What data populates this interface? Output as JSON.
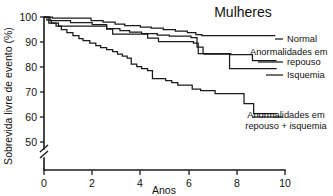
{
  "chart_data": {
    "type": "line",
    "title": "Mulheres",
    "xlabel": "Anos",
    "ylabel": "Sobrevida livre de evento (%)",
    "xlim": [
      0,
      10
    ],
    "ylim": [
      50,
      100
    ],
    "yaxis_break": true,
    "grid": false,
    "legend_position": "right-inline",
    "xticks": [
      "0",
      "2",
      "4",
      "6",
      "8",
      "10"
    ],
    "xtick_values": [
      0,
      2,
      4,
      6,
      8,
      10
    ],
    "yticks": [
      "50",
      "60",
      "70",
      "80",
      "90",
      "100"
    ],
    "ytick_values": [
      50,
      60,
      70,
      80,
      90,
      100
    ],
    "series": [
      {
        "name": "Normal",
        "label": "Normal",
        "end_value": 92.5,
        "points": [
          [
            0.0,
            100.0
          ],
          [
            0.35,
            100.0
          ],
          [
            0.35,
            99.6
          ],
          [
            1.95,
            99.6
          ],
          [
            1.95,
            98.6
          ],
          [
            2.45,
            98.6
          ],
          [
            2.45,
            98.0
          ],
          [
            2.95,
            98.0
          ],
          [
            2.95,
            97.2
          ],
          [
            3.35,
            97.2
          ],
          [
            3.35,
            96.6
          ],
          [
            4.0,
            96.6
          ],
          [
            4.0,
            96.0
          ],
          [
            4.45,
            96.0
          ],
          [
            4.45,
            95.6
          ],
          [
            4.95,
            95.6
          ],
          [
            4.95,
            95.0
          ],
          [
            5.45,
            95.0
          ],
          [
            5.45,
            94.4
          ],
          [
            5.95,
            94.4
          ],
          [
            5.95,
            93.8
          ],
          [
            6.3,
            93.8
          ],
          [
            6.3,
            93.0
          ],
          [
            6.55,
            93.0
          ],
          [
            6.55,
            92.6
          ],
          [
            9.6,
            92.6
          ]
        ]
      },
      {
        "name": "Anormalidades em repouso",
        "label_line1": "Anormalidades em",
        "label_line2": "repouso",
        "end_value": 82.5,
        "points": [
          [
            0.0,
            100.0
          ],
          [
            0.25,
            100.0
          ],
          [
            0.25,
            98.6
          ],
          [
            1.1,
            98.6
          ],
          [
            1.1,
            97.8
          ],
          [
            2.0,
            97.8
          ],
          [
            2.0,
            97.0
          ],
          [
            2.6,
            97.0
          ],
          [
            2.6,
            95.4
          ],
          [
            3.15,
            95.4
          ],
          [
            3.15,
            94.6
          ],
          [
            3.55,
            94.6
          ],
          [
            3.55,
            94.0
          ],
          [
            4.05,
            94.0
          ],
          [
            4.05,
            93.4
          ],
          [
            4.7,
            93.4
          ],
          [
            4.7,
            92.8
          ],
          [
            5.2,
            92.8
          ],
          [
            5.2,
            92.4
          ],
          [
            6.1,
            92.4
          ],
          [
            6.1,
            91.8
          ],
          [
            6.35,
            91.8
          ],
          [
            6.35,
            88.0
          ],
          [
            6.6,
            88.0
          ],
          [
            6.6,
            85.4
          ],
          [
            7.75,
            85.4
          ],
          [
            7.75,
            85.0
          ],
          [
            8.65,
            85.0
          ],
          [
            8.65,
            82.6
          ],
          [
            9.65,
            82.6
          ]
        ]
      },
      {
        "name": "Isquemia",
        "label": "Isquemia",
        "end_value": 79.5,
        "points": [
          [
            0.0,
            100.0
          ],
          [
            0.2,
            100.0
          ],
          [
            0.2,
            97.6
          ],
          [
            0.6,
            97.6
          ],
          [
            0.6,
            96.4
          ],
          [
            2.6,
            96.4
          ],
          [
            2.6,
            95.2
          ],
          [
            2.85,
            95.2
          ],
          [
            2.85,
            93.2
          ],
          [
            4.3,
            93.2
          ],
          [
            4.3,
            91.6
          ],
          [
            4.75,
            91.6
          ],
          [
            4.75,
            90.2
          ],
          [
            6.2,
            90.2
          ],
          [
            6.2,
            89.6
          ],
          [
            6.4,
            89.6
          ],
          [
            6.4,
            85.4
          ],
          [
            6.65,
            85.4
          ],
          [
            6.65,
            85.2
          ],
          [
            7.7,
            85.2
          ],
          [
            7.7,
            79.4
          ],
          [
            9.65,
            79.4
          ]
        ]
      },
      {
        "name": "Anormalidades em repouso + isquemia",
        "label_line1": "Anormalidades em",
        "label_line2": "repouso + isquemia",
        "end_value": 61.5,
        "points": [
          [
            0.0,
            100.0
          ],
          [
            0.12,
            100.0
          ],
          [
            0.12,
            98.8
          ],
          [
            0.3,
            98.8
          ],
          [
            0.3,
            97.6
          ],
          [
            0.5,
            97.6
          ],
          [
            0.5,
            96.4
          ],
          [
            0.72,
            96.4
          ],
          [
            0.72,
            95.0
          ],
          [
            0.95,
            95.0
          ],
          [
            0.95,
            93.8
          ],
          [
            1.2,
            93.8
          ],
          [
            1.2,
            92.6
          ],
          [
            1.45,
            92.6
          ],
          [
            1.45,
            91.4
          ],
          [
            1.62,
            91.4
          ],
          [
            1.62,
            90.6
          ],
          [
            1.9,
            90.6
          ],
          [
            1.9,
            89.6
          ],
          [
            2.15,
            89.6
          ],
          [
            2.15,
            88.6
          ],
          [
            2.35,
            88.6
          ],
          [
            2.35,
            87.8
          ],
          [
            2.6,
            87.8
          ],
          [
            2.6,
            87.0
          ],
          [
            2.85,
            87.0
          ],
          [
            2.85,
            86.2
          ],
          [
            3.05,
            86.2
          ],
          [
            3.05,
            85.2
          ],
          [
            3.25,
            85.2
          ],
          [
            3.25,
            84.4
          ],
          [
            3.45,
            84.4
          ],
          [
            3.45,
            83.6
          ],
          [
            3.62,
            83.6
          ],
          [
            3.62,
            81.2
          ],
          [
            3.85,
            81.2
          ],
          [
            3.85,
            80.2
          ],
          [
            4.05,
            80.2
          ],
          [
            4.05,
            79.4
          ],
          [
            4.3,
            79.4
          ],
          [
            4.3,
            78.6
          ],
          [
            4.5,
            78.6
          ],
          [
            4.5,
            75.4
          ],
          [
            5.05,
            75.4
          ],
          [
            5.05,
            74.6
          ],
          [
            5.3,
            74.6
          ],
          [
            5.3,
            73.8
          ],
          [
            5.55,
            73.8
          ],
          [
            5.55,
            72.8
          ],
          [
            6.15,
            72.8
          ],
          [
            6.15,
            71.2
          ],
          [
            6.5,
            71.2
          ],
          [
            6.5,
            70.6
          ],
          [
            7.1,
            70.6
          ],
          [
            7.1,
            69.4
          ],
          [
            8.3,
            69.4
          ],
          [
            8.3,
            65.4
          ],
          [
            8.7,
            65.4
          ],
          [
            8.7,
            61.4
          ],
          [
            9.65,
            61.4
          ]
        ]
      }
    ]
  },
  "legend": {
    "items": [
      {
        "id": "normal",
        "text": "Normal"
      },
      {
        "id": "repouso-line1",
        "text": "Anormalidades em"
      },
      {
        "id": "repouso-line2",
        "text": "repouso"
      },
      {
        "id": "isquemia",
        "text": "Isquemia"
      },
      {
        "id": "repouso-isquemia-line1",
        "text": "Anormalidades em"
      },
      {
        "id": "repouso-isquemia-line2",
        "text": "repouso + isquemia"
      }
    ]
  },
  "axes": {
    "x_label": "Anos",
    "y_label": "Sobrevida livre de evento (%)",
    "x_ticks": [
      "0",
      "2",
      "4",
      "6",
      "8",
      "10"
    ],
    "y_ticks": [
      "100",
      "90",
      "80",
      "70",
      "60",
      "50"
    ]
  },
  "colors": {
    "ink": "#1a1a1a",
    "background": "#ffffff"
  }
}
